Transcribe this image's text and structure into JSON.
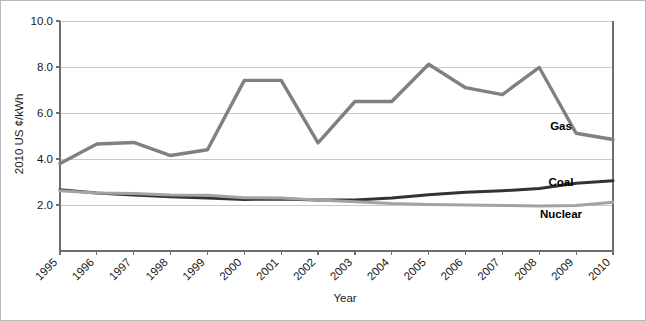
{
  "chart_data": {
    "type": "line",
    "title": "",
    "xlabel": "Year",
    "ylabel": "2010 US ¢/kWh",
    "grid": true,
    "legend_position": "inline-right",
    "x": [
      1995,
      1996,
      1997,
      1998,
      1999,
      2000,
      2001,
      2002,
      2003,
      2004,
      2005,
      2006,
      2007,
      2008,
      2009,
      2010
    ],
    "categories": [
      "1995",
      "1996",
      "1997",
      "1998",
      "1999",
      "2000",
      "2001",
      "2002",
      "2003",
      "2004",
      "2005",
      "2006",
      "2007",
      "2008",
      "2009",
      "2010"
    ],
    "xlim": [
      1995,
      2010
    ],
    "ylim": [
      0.0,
      10.0
    ],
    "yticks": [
      "2.0",
      "4.0",
      "6.0",
      "8.0",
      "10.0"
    ],
    "ytick_values": [
      2.0,
      4.0,
      6.0,
      8.0,
      10.0
    ],
    "series": [
      {
        "name": "Gas",
        "color": "#808080",
        "width": 3.4,
        "label_value": 5.45,
        "values": [
          3.8,
          4.65,
          4.72,
          4.15,
          4.4,
          7.42,
          7.42,
          4.7,
          6.5,
          6.5,
          8.12,
          7.1,
          6.8,
          7.98,
          5.12,
          4.85
        ]
      },
      {
        "name": "Coal",
        "color": "#333333",
        "width": 3.0,
        "label_value": 3.02,
        "values": [
          2.66,
          2.52,
          2.44,
          2.36,
          2.3,
          2.24,
          2.26,
          2.22,
          2.22,
          2.3,
          2.45,
          2.55,
          2.62,
          2.72,
          2.95,
          3.05
        ]
      },
      {
        "name": "Nuclear",
        "color": "#a3a3a3",
        "width": 3.0,
        "label_value": 1.62,
        "values": [
          2.62,
          2.52,
          2.5,
          2.44,
          2.42,
          2.32,
          2.3,
          2.22,
          2.14,
          2.06,
          2.02,
          2.0,
          1.98,
          1.96,
          1.98,
          2.12
        ]
      }
    ]
  }
}
